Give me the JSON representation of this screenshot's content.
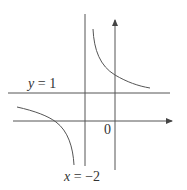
{
  "diagram": {
    "type": "function-graph",
    "colors": {
      "line": "#555555",
      "text": "#333333",
      "background": "#ffffff"
    },
    "labels": {
      "horizontal_asymptote": {
        "var": "y",
        "eq": " = ",
        "value": "1"
      },
      "vertical_asymptote": {
        "var": "x",
        "eq": " = ",
        "value": "−2"
      },
      "origin": "0"
    },
    "geometry": {
      "x_axis": {
        "x1": 13,
        "x2": 173,
        "y": 121
      },
      "y_axis": {
        "x": 115,
        "y1": 170,
        "y2": 19
      },
      "horizontal_asymptote": {
        "x1": 8,
        "x2": 170,
        "y": 93
      },
      "vertical_asymptote": {
        "x": 85,
        "y1": 14,
        "y2": 166
      }
    }
  }
}
